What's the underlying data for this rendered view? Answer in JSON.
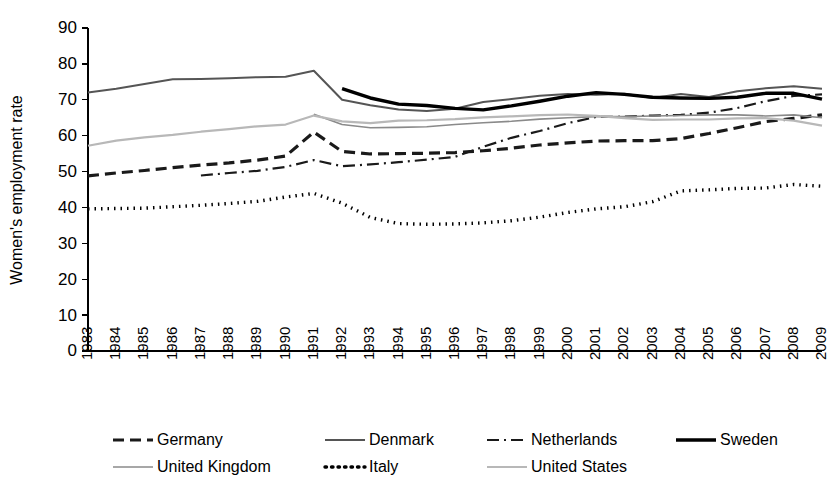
{
  "chart_data": {
    "type": "line",
    "title": "",
    "xlabel": "",
    "ylabel": "Women's employment rate",
    "ylim": [
      0,
      90
    ],
    "ytick_step": 10,
    "grid": false,
    "legend_position": "bottom",
    "yticks": [
      "0",
      "10",
      "20",
      "30",
      "40",
      "50",
      "60",
      "70",
      "80",
      "90"
    ],
    "categories": [
      "1983",
      "1984",
      "1985",
      "1986",
      "1987",
      "1988",
      "1989",
      "1990",
      "1991",
      "1992",
      "1993",
      "1994",
      "1995",
      "1996",
      "1997",
      "1998",
      "1999",
      "2000",
      "2001",
      "2002",
      "2003",
      "2004",
      "2005",
      "2006",
      "2007",
      "2008",
      "2009"
    ],
    "series": [
      {
        "name": "Germany",
        "style": "dashed",
        "color": "#1a1a1a",
        "width": 3.2,
        "dash": "11,6",
        "values": [
          48.8,
          49.6,
          50.3,
          51.1,
          51.8,
          52.4,
          53.2,
          54.3,
          61.0,
          55.6,
          54.9,
          55.0,
          55.1,
          55.3,
          55.8,
          56.5,
          57.4,
          58.0,
          58.5,
          58.6,
          58.6,
          59.2,
          60.6,
          62.2,
          63.9,
          64.8,
          65.8
        ]
      },
      {
        "name": "Denmark",
        "style": "solid-gray",
        "color": "#555555",
        "width": 2.0,
        "dash": "",
        "values": [
          72.0,
          73.1,
          74.4,
          75.7,
          75.8,
          76.0,
          76.3,
          76.4,
          78.1,
          70.0,
          68.5,
          67.3,
          66.9,
          67.5,
          69.4,
          70.2,
          71.1,
          71.6,
          71.4,
          71.7,
          70.5,
          71.6,
          70.8,
          72.4,
          73.2,
          73.8,
          73.1
        ]
      },
      {
        "name": "Netherlands",
        "style": "dash-dot",
        "color": "#1a1a1a",
        "width": 2.2,
        "dash": "12,5,2,5",
        "values": [
          null,
          null,
          null,
          null,
          48.9,
          49.6,
          50.2,
          51.3,
          53.2,
          51.5,
          52.0,
          52.6,
          53.3,
          54.1,
          56.9,
          59.4,
          61.3,
          63.5,
          65.2,
          65.3,
          65.6,
          65.8,
          66.4,
          67.7,
          69.6,
          71.1,
          71.5
        ]
      },
      {
        "name": "Sweden",
        "style": "solid-black",
        "color": "#000000",
        "width": 3.4,
        "dash": "",
        "values": [
          null,
          null,
          null,
          null,
          null,
          null,
          null,
          null,
          null,
          73.1,
          70.5,
          68.8,
          68.4,
          67.6,
          67.2,
          68.3,
          69.6,
          71.0,
          72.0,
          71.5,
          70.7,
          70.5,
          70.4,
          70.7,
          71.8,
          71.8,
          70.2
        ]
      },
      {
        "name": "United Kingdom",
        "style": "thin-gray",
        "color": "#8a8a8a",
        "width": 1.6,
        "dash": "",
        "values": [
          null,
          null,
          null,
          null,
          null,
          null,
          null,
          null,
          66.0,
          63.1,
          62.2,
          62.3,
          62.5,
          63.1,
          63.6,
          64.0,
          64.6,
          65.0,
          65.3,
          65.3,
          65.5,
          65.6,
          65.8,
          65.8,
          65.5,
          65.8,
          65.0
        ]
      },
      {
        "name": "Italy",
        "style": "dotted",
        "color": "#000000",
        "width": 3.4,
        "dash": "1.5,5",
        "values": [
          39.6,
          39.7,
          39.8,
          40.2,
          40.6,
          41.1,
          41.7,
          42.9,
          43.9,
          41.2,
          37.2,
          35.5,
          35.3,
          35.4,
          35.7,
          36.3,
          37.3,
          38.6,
          39.6,
          40.2,
          41.6,
          44.6,
          44.9,
          45.3,
          45.4,
          46.4,
          45.9
        ]
      },
      {
        "name": "United States",
        "style": "light-gray",
        "color": "#b8b8b8",
        "width": 2.2,
        "dash": "",
        "values": [
          57.2,
          58.6,
          59.5,
          60.2,
          61.1,
          61.8,
          62.6,
          63.1,
          65.6,
          64.0,
          63.5,
          64.2,
          64.3,
          64.6,
          65.1,
          65.4,
          65.7,
          65.9,
          65.5,
          64.9,
          64.4,
          64.5,
          64.5,
          64.8,
          64.9,
          64.2,
          62.8
        ]
      }
    ]
  },
  "legend": {
    "rows": [
      [
        {
          "label": "Germany",
          "key": "germany"
        },
        {
          "label": "Denmark",
          "key": "denmark"
        },
        {
          "label": "Netherlands",
          "key": "netherlands"
        },
        {
          "label": "Sweden",
          "key": "sweden"
        }
      ],
      [
        {
          "label": "United Kingdom",
          "key": "united-kingdom"
        },
        {
          "label": "Italy",
          "key": "italy"
        },
        {
          "label": "United States",
          "key": "united-states"
        }
      ]
    ]
  }
}
